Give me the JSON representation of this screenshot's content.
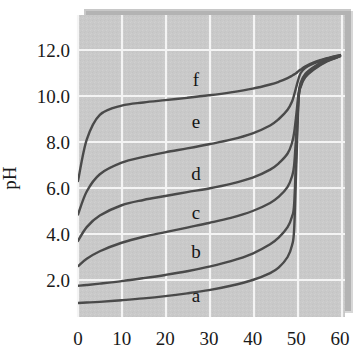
{
  "figure": {
    "background_color": "#ffffff",
    "plot_background_color": "#c9c9c9",
    "gridline_color": "#f2f2f2",
    "curve_color": "#4a4a4a",
    "shadow_color": "#8f8f8f",
    "text_color": "#1a1a1a"
  },
  "chart_data": {
    "type": "line",
    "title": "",
    "subtitle": "",
    "xlabel": "",
    "ylabel": "pH",
    "xlim": [
      0,
      60
    ],
    "ylim": [
      0.0,
      13.0
    ],
    "grid": true,
    "legend_position": "inline-labels",
    "xticks": [
      0,
      10,
      20,
      30,
      40,
      50,
      60
    ],
    "xticklabels": [
      "0",
      "10",
      "20",
      "30",
      "40",
      "50",
      "60"
    ],
    "yticks": [
      2.0,
      4.0,
      6.0,
      8.0,
      10.0,
      12.0
    ],
    "yticklabels": [
      "2.0",
      "4.0",
      "6.0",
      "8.0",
      "10.0",
      "12.0"
    ],
    "annotations": [
      {
        "text": "f",
        "x": 27.0,
        "y": 10.45
      },
      {
        "text": "e",
        "x": 27.0,
        "y": 8.6
      },
      {
        "text": "d",
        "x": 27.0,
        "y": 6.35
      },
      {
        "text": "c",
        "x": 27.0,
        "y": 4.65
      },
      {
        "text": "b",
        "x": 27.0,
        "y": 2.95
      },
      {
        "text": "a",
        "x": 27.0,
        "y": 1.05
      }
    ],
    "series": [
      {
        "name": "a",
        "x": [
          0.0,
          2.0,
          5.0,
          10.0,
          15.0,
          20.0,
          25.0,
          30.0,
          35.0,
          40.0,
          44.0,
          46.0,
          48.0,
          49.0,
          49.5,
          50.0,
          50.5,
          51.0,
          52.0,
          54.0,
          57.0,
          60.0
        ],
        "y": [
          1.0,
          1.02,
          1.05,
          1.12,
          1.2,
          1.3,
          1.42,
          1.56,
          1.75,
          2.0,
          2.3,
          2.55,
          3.0,
          3.5,
          4.2,
          7.0,
          9.8,
          10.4,
          10.8,
          11.15,
          11.5,
          11.72
        ]
      },
      {
        "name": "b",
        "x": [
          0.0,
          2.0,
          5.0,
          10.0,
          15.0,
          20.0,
          25.0,
          30.0,
          35.0,
          40.0,
          44.0,
          46.0,
          48.0,
          49.0,
          49.5,
          50.0,
          50.5,
          51.0,
          52.0,
          54.0,
          57.0,
          60.0
        ],
        "y": [
          1.75,
          1.78,
          1.84,
          1.95,
          2.08,
          2.22,
          2.38,
          2.58,
          2.82,
          3.15,
          3.55,
          3.85,
          4.3,
          4.75,
          5.3,
          7.6,
          9.9,
          10.45,
          10.85,
          11.18,
          11.52,
          11.73
        ]
      },
      {
        "name": "c",
        "x": [
          0.0,
          2.0,
          5.0,
          10.0,
          15.0,
          20.0,
          25.0,
          30.0,
          35.0,
          40.0,
          44.0,
          46.0,
          48.0,
          49.0,
          49.5,
          50.0,
          50.5,
          51.0,
          52.0,
          54.0,
          57.0,
          60.0
        ],
        "y": [
          2.6,
          2.92,
          3.25,
          3.62,
          3.88,
          4.08,
          4.28,
          4.48,
          4.7,
          5.0,
          5.35,
          5.62,
          6.05,
          6.5,
          7.0,
          8.4,
          9.95,
          10.5,
          10.9,
          11.22,
          11.55,
          11.74
        ]
      },
      {
        "name": "d",
        "x": [
          0.0,
          2.0,
          5.0,
          10.0,
          15.0,
          20.0,
          25.0,
          30.0,
          35.0,
          40.0,
          44.0,
          46.0,
          48.0,
          49.0,
          49.5,
          50.0,
          50.5,
          51.0,
          52.0,
          54.0,
          57.0,
          60.0
        ],
        "y": [
          3.7,
          4.3,
          4.8,
          5.25,
          5.48,
          5.65,
          5.82,
          5.98,
          6.18,
          6.45,
          6.8,
          7.08,
          7.5,
          7.95,
          8.4,
          9.2,
          10.1,
          10.58,
          10.95,
          11.26,
          11.58,
          11.75
        ]
      },
      {
        "name": "e",
        "x": [
          0.0,
          2.0,
          5.0,
          10.0,
          15.0,
          20.0,
          25.0,
          30.0,
          35.0,
          40.0,
          44.0,
          46.0,
          48.0,
          49.0,
          49.5,
          50.0,
          50.5,
          51.0,
          52.0,
          54.0,
          57.0,
          60.0
        ],
        "y": [
          4.85,
          5.85,
          6.6,
          7.1,
          7.35,
          7.55,
          7.72,
          7.9,
          8.1,
          8.38,
          8.72,
          9.0,
          9.4,
          9.75,
          10.05,
          10.4,
          10.75,
          11.0,
          11.22,
          11.42,
          11.62,
          11.77
        ]
      },
      {
        "name": "f",
        "x": [
          0.0,
          2.0,
          5.0,
          10.0,
          15.0,
          20.0,
          25.0,
          30.0,
          35.0,
          40.0,
          44.0,
          46.0,
          48.0,
          49.0,
          49.5,
          50.0,
          50.5,
          51.0,
          52.0,
          54.0,
          57.0,
          60.0
        ],
        "y": [
          6.3,
          8.1,
          9.18,
          9.58,
          9.72,
          9.82,
          9.92,
          10.03,
          10.16,
          10.32,
          10.5,
          10.62,
          10.78,
          10.88,
          10.94,
          11.0,
          11.08,
          11.15,
          11.28,
          11.46,
          11.64,
          11.78
        ]
      }
    ]
  }
}
